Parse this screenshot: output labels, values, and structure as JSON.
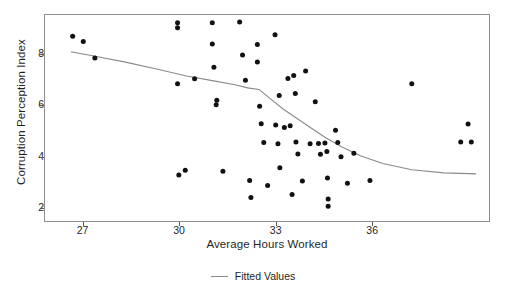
{
  "chart_data": {
    "type": "scatter",
    "title": "",
    "xlabel": "Average Hours Worked",
    "ylabel": "Corruption Perception Index",
    "xlim": [
      25.8,
      39.6
    ],
    "ylim": [
      1.55,
      9.55
    ],
    "xticks": [
      27,
      30,
      33,
      36
    ],
    "yticks": [
      2,
      4,
      6,
      8
    ],
    "grid": false,
    "legend_position": "bottom-center",
    "series": [
      {
        "name": "Observations",
        "type": "scatter",
        "marker": "filled-circle",
        "color": "#111111",
        "points": [
          [
            26.66,
            8.72
          ],
          [
            26.99,
            8.52
          ],
          [
            27.35,
            7.88
          ],
          [
            29.92,
            9.25
          ],
          [
            29.92,
            9.05
          ],
          [
            29.92,
            6.88
          ],
          [
            29.96,
            3.34
          ],
          [
            30.16,
            3.52
          ],
          [
            30.45,
            7.07
          ],
          [
            31.0,
            9.25
          ],
          [
            31.0,
            8.42
          ],
          [
            31.05,
            7.52
          ],
          [
            31.12,
            6.06
          ],
          [
            31.14,
            6.24
          ],
          [
            31.33,
            3.48
          ],
          [
            31.85,
            9.28
          ],
          [
            31.94,
            8.0
          ],
          [
            32.03,
            7.02
          ],
          [
            32.16,
            3.12
          ],
          [
            32.2,
            2.46
          ],
          [
            32.4,
            8.4
          ],
          [
            32.4,
            7.72
          ],
          [
            32.47,
            6.01
          ],
          [
            32.52,
            5.33
          ],
          [
            32.6,
            4.6
          ],
          [
            32.72,
            2.93
          ],
          [
            32.95,
            8.78
          ],
          [
            32.97,
            5.28
          ],
          [
            33.04,
            4.55
          ],
          [
            33.08,
            6.42
          ],
          [
            33.1,
            3.62
          ],
          [
            33.24,
            5.18
          ],
          [
            33.35,
            7.08
          ],
          [
            33.42,
            5.25
          ],
          [
            33.48,
            2.58
          ],
          [
            33.53,
            7.2
          ],
          [
            33.58,
            6.5
          ],
          [
            33.6,
            4.62
          ],
          [
            33.66,
            4.15
          ],
          [
            33.8,
            3.1
          ],
          [
            33.9,
            7.38
          ],
          [
            34.04,
            4.55
          ],
          [
            34.2,
            6.18
          ],
          [
            34.3,
            4.56
          ],
          [
            34.36,
            4.14
          ],
          [
            34.5,
            4.58
          ],
          [
            34.56,
            4.25
          ],
          [
            34.58,
            3.22
          ],
          [
            34.6,
            2.4
          ],
          [
            34.6,
            2.12
          ],
          [
            34.83,
            5.07
          ],
          [
            34.9,
            4.6
          ],
          [
            35.0,
            4.05
          ],
          [
            35.2,
            3.02
          ],
          [
            35.4,
            4.18
          ],
          [
            35.9,
            3.12
          ],
          [
            37.2,
            6.88
          ],
          [
            38.95,
            5.32
          ],
          [
            38.72,
            4.62
          ],
          [
            39.05,
            4.62
          ]
        ]
      },
      {
        "name": "Fitted Values",
        "type": "line",
        "color": "#8a8a8a",
        "points": [
          [
            26.6,
            8.12
          ],
          [
            27.4,
            7.94
          ],
          [
            28.3,
            7.72
          ],
          [
            29.3,
            7.44
          ],
          [
            30.2,
            7.18
          ],
          [
            31.0,
            7.0
          ],
          [
            31.7,
            6.84
          ],
          [
            32.1,
            6.72
          ],
          [
            32.45,
            6.66
          ],
          [
            32.8,
            6.3
          ],
          [
            33.2,
            5.9
          ],
          [
            33.6,
            5.56
          ],
          [
            34.0,
            5.22
          ],
          [
            34.5,
            4.8
          ],
          [
            35.0,
            4.44
          ],
          [
            35.6,
            4.08
          ],
          [
            36.3,
            3.78
          ],
          [
            37.2,
            3.54
          ],
          [
            38.2,
            3.42
          ],
          [
            39.2,
            3.38
          ]
        ]
      }
    ]
  },
  "axes": {
    "ylabel": "Corruption Perception Index",
    "xlabel": "Average Hours Worked",
    "ytick_labels": [
      "8",
      "6",
      "4",
      "2"
    ],
    "xtick_labels": [
      "27",
      "30",
      "33",
      "36"
    ]
  },
  "legend": {
    "items": [
      {
        "label": "Fitted Values",
        "marker": "line",
        "color": "#8a8a8a"
      }
    ]
  }
}
